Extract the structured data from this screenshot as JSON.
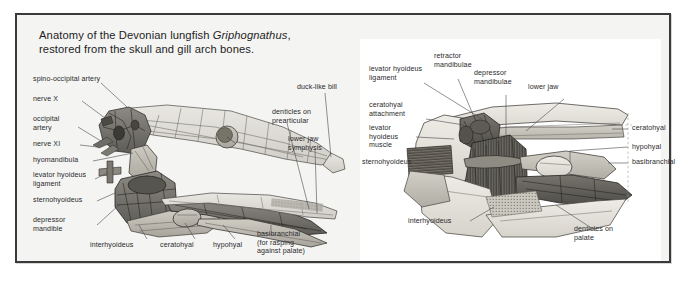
{
  "figure": {
    "caption_line1_a": "Anatomy of the Devonian lungfish ",
    "caption_genus": "Griphognathus",
    "caption_line1_b": ",",
    "caption_line2": "restored from the skull and gill arch bones.",
    "frame_color": "#3a3a3c",
    "page_background": "#f4f4f2",
    "panel_background": "#ffffff",
    "label_color": "#2a2a2c",
    "leader_color": "#4a4a4c"
  },
  "left_panel": {
    "title": "lateral view of skull and gill arch skeleton",
    "labels": [
      {
        "id": "spino-occipital-artery",
        "text": "spino-occipital artery"
      },
      {
        "id": "nerve-x",
        "text": "nerve X"
      },
      {
        "id": "occipital-artery",
        "text": "occipital\nartery"
      },
      {
        "id": "nerve-xi",
        "text": "nerve XI"
      },
      {
        "id": "hyomandibula",
        "text": "hyomandibula"
      },
      {
        "id": "levator-hyoideus-ligament",
        "text": "levator hyoideus\nligament"
      },
      {
        "id": "sternohyoideus",
        "text": "sternohyoideus"
      },
      {
        "id": "depressor-mandible",
        "text": "depressor\nmandible"
      },
      {
        "id": "interhyoideus",
        "text": "interhyoideus"
      },
      {
        "id": "ceratohyal",
        "text": "ceratohyal"
      },
      {
        "id": "hypohyal",
        "text": "hypohyal"
      },
      {
        "id": "basibranchial",
        "text": "basibranchial\n(for rasping\nagainst palate)"
      },
      {
        "id": "duck-like-bill",
        "text": "duck-like bill"
      },
      {
        "id": "denticles-on-prearticular",
        "text": "denticles on\nprearticular"
      },
      {
        "id": "lower-jaw-symphysis",
        "text": "lower jaw\nsymphysis"
      }
    ]
  },
  "right_panel": {
    "title": "detail of hyoid arch musculature",
    "labels": [
      {
        "id": "levator-hyoideus-ligament",
        "text": "levator hyoideus\nligament"
      },
      {
        "id": "retractor-mandibulae",
        "text": "retractor\nmandibulae"
      },
      {
        "id": "depressor-mandibulae",
        "text": "depressor\nmandibulae"
      },
      {
        "id": "lower-jaw",
        "text": "lower jaw"
      },
      {
        "id": "ceratohyal-attachment",
        "text": "ceratohyal\nattachment"
      },
      {
        "id": "levator-hyoideus-muscle",
        "text": "levator\nhyoideus\nmuscle"
      },
      {
        "id": "sternohyoideus",
        "text": "sternohyoideus"
      },
      {
        "id": "interhyoideus",
        "text": "interhyoideus"
      },
      {
        "id": "ceratohyal",
        "text": "ceratohyal"
      },
      {
        "id": "hypohyal",
        "text": "hypohyal"
      },
      {
        "id": "basibranchial",
        "text": "basibranchial"
      },
      {
        "id": "denticles-on-palate",
        "text": "denticles on\npalate"
      }
    ]
  }
}
